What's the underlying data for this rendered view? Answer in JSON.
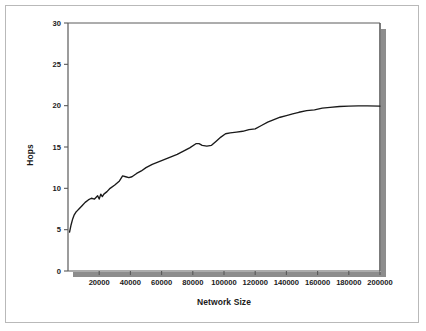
{
  "figure": {
    "background_color": "#ffffff",
    "frame_color": "#b9b9b9",
    "axis_color": "#5a5a5a",
    "series_color": "#1a1a1a",
    "shadow_color": "#8d8d8d"
  },
  "chart_data": {
    "type": "line",
    "title": "",
    "xlabel": "Network Size",
    "ylabel": "Hops",
    "xlim": [
      0,
      200000
    ],
    "ylim": [
      0,
      30
    ],
    "grid": false,
    "legend": null,
    "xticks": [
      20000,
      40000,
      60000,
      80000,
      100000,
      120000,
      140000,
      160000,
      180000,
      200000
    ],
    "xticklabels": [
      "20000",
      "40000",
      "60000",
      "80000",
      "100000",
      "120000",
      "140000",
      "160000",
      "180000",
      "200000"
    ],
    "yticks": [
      0,
      5,
      10,
      15,
      20,
      25,
      30
    ],
    "yticklabels": [
      "0",
      "5",
      "10",
      "15",
      "20",
      "25",
      "30"
    ],
    "series": [
      {
        "name": "Hops vs Network Size",
        "x": [
          1000,
          2000,
          3000,
          4000,
          5000,
          6000,
          7000,
          9000,
          11000,
          13000,
          15000,
          17000,
          19000,
          20000,
          21000,
          22000,
          23000,
          25000,
          27000,
          30000,
          33000,
          35000,
          37000,
          39000,
          41000,
          44000,
          47000,
          50000,
          54000,
          58000,
          62000,
          66000,
          70000,
          74000,
          78000,
          82000,
          84000,
          86000,
          89000,
          92000,
          95000,
          98000,
          101000,
          104000,
          108000,
          112000,
          116000,
          120000,
          124000,
          128000,
          132000,
          136000,
          140000,
          144000,
          148000,
          153000,
          158000,
          163000,
          168000,
          174000,
          180000,
          186000,
          192000,
          200000
        ],
        "y": [
          4.7,
          5.6,
          6.3,
          6.8,
          7.1,
          7.3,
          7.5,
          7.9,
          8.3,
          8.6,
          8.8,
          8.7,
          9.1,
          8.7,
          9.3,
          9.0,
          9.3,
          9.6,
          10.0,
          10.4,
          10.9,
          11.5,
          11.4,
          11.3,
          11.4,
          11.8,
          12.1,
          12.5,
          12.9,
          13.2,
          13.5,
          13.8,
          14.1,
          14.5,
          14.9,
          15.4,
          15.4,
          15.2,
          15.1,
          15.2,
          15.7,
          16.2,
          16.6,
          16.7,
          16.8,
          16.9,
          17.1,
          17.2,
          17.6,
          18.0,
          18.3,
          18.6,
          18.8,
          19.0,
          19.2,
          19.4,
          19.5,
          19.7,
          19.8,
          19.9,
          19.95,
          19.97,
          19.98,
          19.95
        ]
      }
    ]
  }
}
